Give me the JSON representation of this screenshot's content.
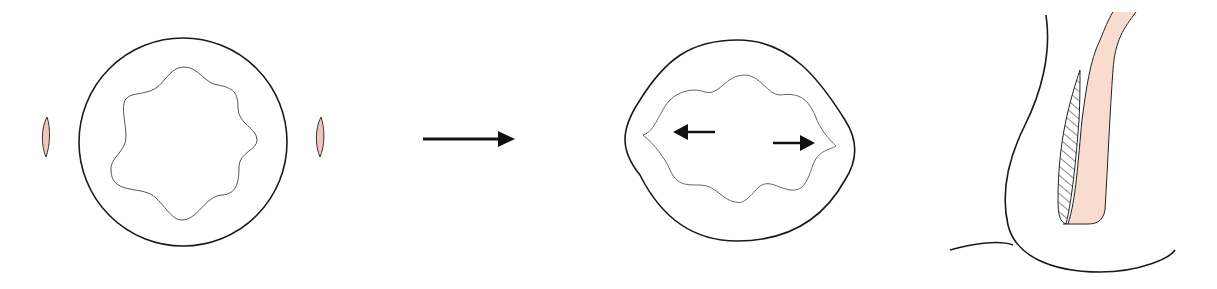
{
  "diagram": {
    "colors": {
      "stroke": "#1a1a1a",
      "inner_stroke": "#555555",
      "pink_fill": "#f2c4c0",
      "band_fill": "#f8dcd0",
      "background": "#ffffff"
    },
    "panels": [
      {
        "id": "panel-1",
        "label": "Initial circular state",
        "elements": [
          "outer-circle",
          "wavy-inner-border",
          "left-pink-slit",
          "right-pink-slit"
        ]
      },
      {
        "id": "transition",
        "label": "Transition arrow",
        "elements": [
          "right-arrow"
        ]
      },
      {
        "id": "panel-2",
        "label": "Laterally stretched state",
        "elements": [
          "outer-rounded-rhombus",
          "wavy-inner-border-stretched",
          "left-arrow",
          "right-arrow"
        ]
      },
      {
        "id": "panel-3",
        "label": "Sagittal section",
        "elements": [
          "outer-curve",
          "pink-band",
          "hatched-region",
          "base-curve"
        ]
      }
    ]
  }
}
